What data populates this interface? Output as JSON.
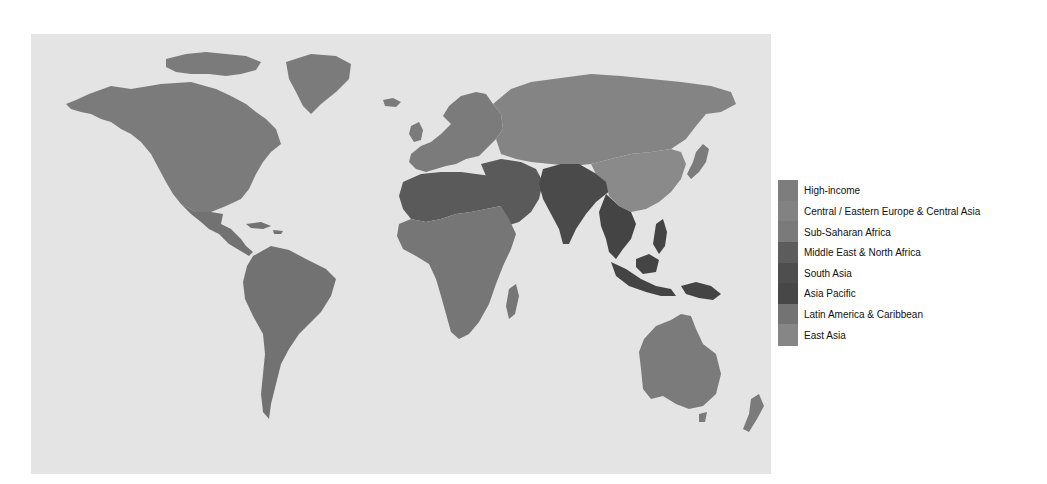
{
  "colors": {
    "ocean": "#e4e4e4",
    "high_income": "#7b7b7b",
    "central_eastern_europe": "#848484",
    "sub_saharan_africa": "#767676",
    "middle_east_north_africa": "#5a5a5a",
    "south_asia": "#4a4a4a",
    "asia_pacific": "#444444",
    "latin_america": "#727272",
    "east_asia": "#8a8a8a"
  },
  "legend": {
    "items": [
      {
        "label": "High-income",
        "color": "#7d7d7d"
      },
      {
        "label": "Central / Eastern Europe & Central Asia",
        "color": "#828282"
      },
      {
        "label": "Sub-Saharan Africa",
        "color": "#7a7a7a"
      },
      {
        "label": "Middle East & North Africa",
        "color": "#5c5c5c"
      },
      {
        "label": "South Asia",
        "color": "#4e4e4e"
      },
      {
        "label": "Asia Pacific",
        "color": "#474747"
      },
      {
        "label": "Latin America & Caribbean",
        "color": "#737373"
      },
      {
        "label": "East Asia",
        "color": "#868686"
      }
    ]
  },
  "regions": [
    {
      "name": "north-america",
      "group": "high_income"
    },
    {
      "name": "greenland",
      "group": "high_income"
    },
    {
      "name": "canadian-arctic",
      "group": "high_income"
    },
    {
      "name": "mexico-central-america",
      "group": "latin_america"
    },
    {
      "name": "south-america",
      "group": "latin_america"
    },
    {
      "name": "caribbean",
      "group": "latin_america"
    },
    {
      "name": "europe",
      "group": "high_income"
    },
    {
      "name": "russia-central-asia",
      "group": "central_eastern_europe"
    },
    {
      "name": "north-africa",
      "group": "middle_east_north_africa"
    },
    {
      "name": "middle-east",
      "group": "middle_east_north_africa"
    },
    {
      "name": "sub-saharan-africa",
      "group": "sub_saharan_africa"
    },
    {
      "name": "madagascar",
      "group": "sub_saharan_africa"
    },
    {
      "name": "south-asia",
      "group": "south_asia"
    },
    {
      "name": "china",
      "group": "east_asia"
    },
    {
      "name": "japan",
      "group": "high_income"
    },
    {
      "name": "southeast-asia",
      "group": "asia_pacific"
    },
    {
      "name": "indonesia",
      "group": "asia_pacific"
    },
    {
      "name": "philippines",
      "group": "asia_pacific"
    },
    {
      "name": "new-guinea",
      "group": "asia_pacific"
    },
    {
      "name": "australia",
      "group": "high_income"
    },
    {
      "name": "new-zealand",
      "group": "high_income"
    },
    {
      "name": "iceland",
      "group": "high_income"
    },
    {
      "name": "uk",
      "group": "high_income"
    }
  ]
}
